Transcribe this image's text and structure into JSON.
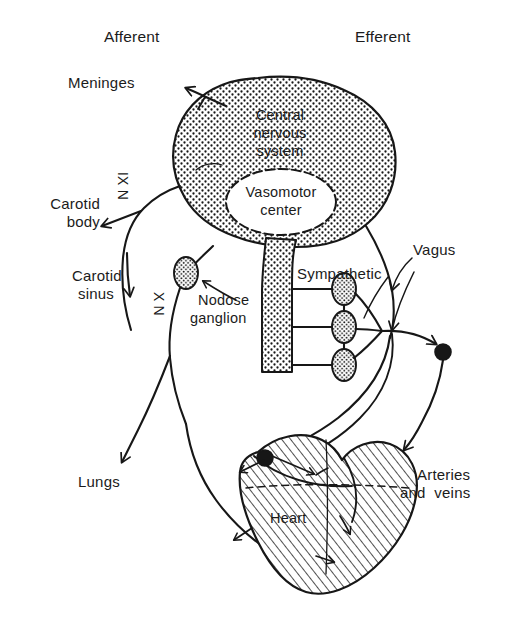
{
  "figure": {
    "background_color": "#ffffff",
    "ink_color": "#171717"
  },
  "headers": {
    "afferent": "Afferent",
    "efferent": "Efferent"
  },
  "structures": {
    "cns": {
      "line1": "Central",
      "line2": "nervous",
      "line3": "system",
      "fill": "stipple"
    },
    "vasomotor_center": {
      "line1": "Vasomotor",
      "line2": "center",
      "fill": "white"
    },
    "heart": {
      "label": "Heart",
      "fill": "hatch"
    },
    "spinal_cord": {
      "fill": "stipple"
    }
  },
  "labels_left": [
    {
      "id": "meninges",
      "text": "Meninges"
    },
    {
      "id": "carotid-body",
      "line1": "Carotid",
      "line2": "body"
    },
    {
      "id": "carotid-sinus",
      "line1": "Carotid",
      "line2": "sinus"
    },
    {
      "id": "lungs",
      "text": "Lungs"
    }
  ],
  "labels_right": [
    {
      "id": "vagus",
      "text": "Vagus"
    },
    {
      "id": "sympathetic",
      "text": "Sympathetic"
    },
    {
      "id": "arteries-veins",
      "line1": "Arteries",
      "line2": "and  veins"
    }
  ],
  "labels_inner": [
    {
      "id": "nodose-ganglion",
      "line1": "Nodose",
      "line2": "ganglion"
    }
  ],
  "nerve_labels": [
    {
      "id": "nerve-ix",
      "text": "IX N",
      "meaning": "glossopharyngeal nerve",
      "rotation": 90
    },
    {
      "id": "nerve-x",
      "text": "X N",
      "meaning": "vagus nerve",
      "rotation": 90
    }
  ],
  "ganglia": {
    "sympathetic_chain_count": 3,
    "nodose_count": 1,
    "filled_knob_count": 2
  }
}
